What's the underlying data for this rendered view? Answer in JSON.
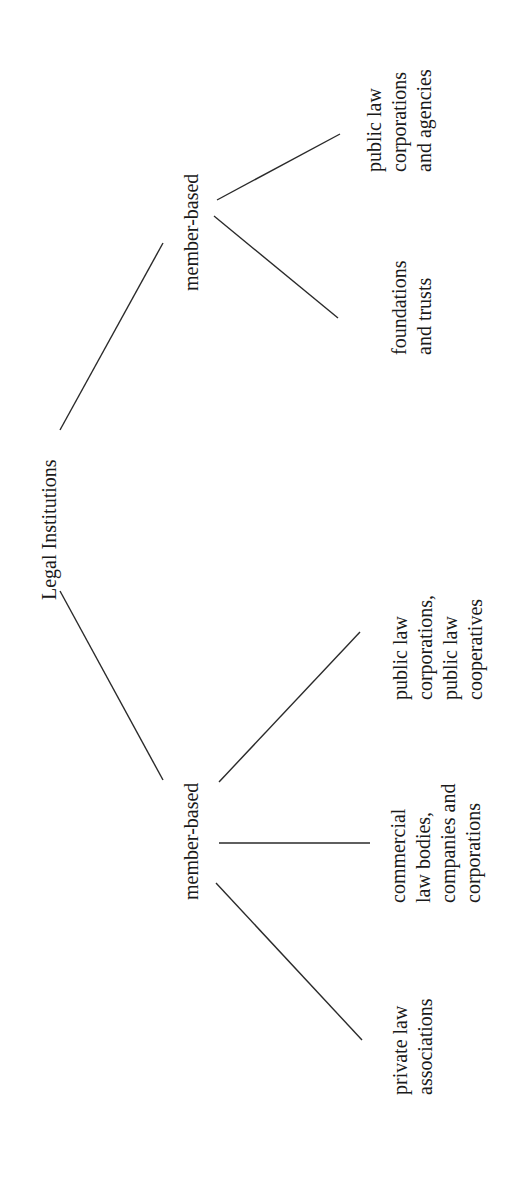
{
  "diagram": {
    "type": "tree",
    "orientation": "rotated 90deg counter-clockwise (root at left, leaves at right)",
    "root": {
      "label": "Legal Institutions"
    },
    "branches": [
      {
        "label": "member-based",
        "children": [
          {
            "label": "private law\nassociations"
          },
          {
            "label": "commercial\nlaw bodies,\ncompanies and\ncorporations"
          },
          {
            "label": "public law\ncorporations,\npublic law\ncooperatives"
          }
        ]
      },
      {
        "label": "member-based",
        "children": [
          {
            "label": "foundations\nand trusts"
          },
          {
            "label": "public law\ncorporations\nand agencies"
          }
        ]
      }
    ],
    "colors": {
      "background": "#ffffff",
      "text": "#1a1a1a",
      "lines": "#2a2a2a"
    }
  }
}
